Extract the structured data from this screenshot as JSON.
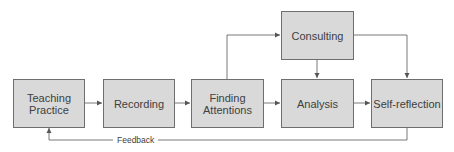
{
  "diagram": {
    "nodes": [
      {
        "id": "teaching-practice",
        "label": "Teaching\nPractice",
        "line1": "Teaching",
        "line2": "Practice"
      },
      {
        "id": "recording",
        "label": "Recording"
      },
      {
        "id": "finding-attentions",
        "label": "Finding\nAttentions",
        "line1": "Finding",
        "line2": "Attentions"
      },
      {
        "id": "consulting",
        "label": "Consulting"
      },
      {
        "id": "analysis",
        "label": "Analysis"
      },
      {
        "id": "self-reflection",
        "label": "Self-reflection"
      }
    ],
    "edges": [
      {
        "from": "teaching-practice",
        "to": "recording"
      },
      {
        "from": "recording",
        "to": "finding-attentions"
      },
      {
        "from": "finding-attentions",
        "to": "analysis"
      },
      {
        "from": "finding-attentions",
        "to": "consulting"
      },
      {
        "from": "consulting",
        "to": "analysis"
      },
      {
        "from": "consulting",
        "to": "self-reflection"
      },
      {
        "from": "analysis",
        "to": "self-reflection"
      },
      {
        "from": "self-reflection",
        "to": "teaching-practice",
        "label": "Feedback"
      }
    ],
    "feedback_label": "Feedback",
    "colors": {
      "box_fill": "#d9d9d9",
      "box_border": "#6e6e6e",
      "line": "#555555",
      "text": "#404040"
    }
  }
}
